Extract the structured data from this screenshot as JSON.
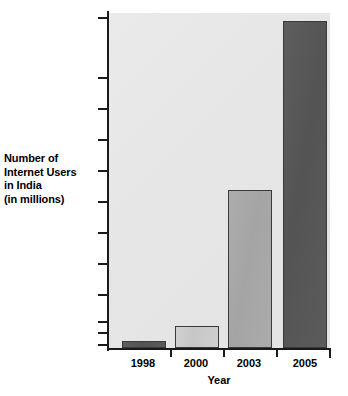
{
  "chart_data": {
    "type": "bar",
    "title": "",
    "categories": [
      "1998",
      "2000",
      "2003",
      "2005"
    ],
    "values": [
      1.5,
      4.5,
      24,
      48.8
    ],
    "series": [
      {
        "name": "Number of Internet Users in India (in millions)",
        "values": [
          1.5,
          4.5,
          24,
          48.8
        ]
      }
    ],
    "xlabel": "Year",
    "ylabel": "Number of Internet Users in India (in millions)",
    "ylabel_lines": [
      "Number of",
      "Internet Users",
      "in India",
      "(in millions)"
    ],
    "ylim": [
      0,
      50
    ],
    "yticks": [
      1,
      3,
      5,
      10,
      15,
      20,
      25,
      30,
      35,
      40,
      45,
      50
    ],
    "ytick_labels": [
      "1",
      "3",
      "5",
      "10",
      "15",
      "20",
      "25",
      "30",
      "35",
      "40",
      "45",
      "50"
    ],
    "grid": false,
    "legend": false,
    "bar_styles": [
      "dark",
      "light",
      "mid",
      "dark"
    ],
    "colors": {
      "plot_background": "#e6e6e6",
      "axis": "#1a1a1a",
      "bar_light": "#cccccc",
      "bar_mid": "#a8a8a8",
      "bar_dark": "#585858",
      "bar_border": "#3a3a3a",
      "text": "#000000"
    }
  },
  "axis_geometry": {
    "ytick_y_px": [
      345,
      333,
      322,
      295,
      264,
      233,
      202,
      171,
      140,
      109,
      78,
      18
    ],
    "xcat_center_px": [
      143,
      196,
      249,
      305
    ],
    "xtick_x_px": [
      170,
      223,
      276
    ],
    "bar_left_px": [
      122,
      175,
      228,
      283
    ],
    "bar_width_px": 44,
    "bar_top_px": [
      341,
      326,
      190,
      21
    ],
    "baseline_y_px": 348
  }
}
